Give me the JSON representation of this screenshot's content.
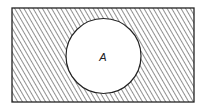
{
  "diagram": {
    "type": "venn",
    "universe": {
      "shaded": true,
      "pattern": "diagonal-hatch"
    },
    "sets": [
      {
        "label": "A",
        "shaded": false
      }
    ],
    "colors": {
      "stroke": "#222222",
      "hatch": "#333333",
      "background": "#ffffff"
    }
  }
}
